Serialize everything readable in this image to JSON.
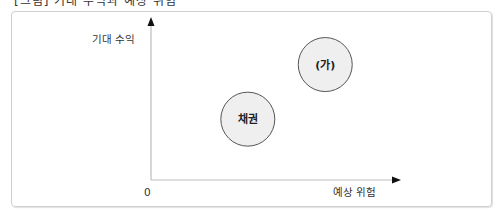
{
  "caption": "[그림] 기대 수익과 예상 위험",
  "diagram": {
    "y_axis_label": "기대 수익",
    "x_axis_label": "예상 위험",
    "origin_label": "0",
    "items": [
      {
        "label": "채권",
        "risk": 0.4,
        "return": 0.39
      },
      {
        "label": "(가)",
        "risk": 0.72,
        "return": 0.74
      }
    ],
    "colors": {
      "circle_fill": "#efefef",
      "circle_stroke": "#555555",
      "axis": "#000000"
    }
  }
}
